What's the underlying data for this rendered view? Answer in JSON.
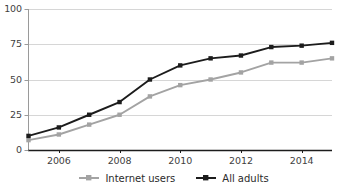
{
  "chart_data": {
    "type": "line",
    "title": "",
    "subtitle": "",
    "xlabel": "",
    "ylabel": "",
    "x": [
      2005,
      2006,
      2007,
      2008,
      2009,
      2010,
      2011,
      2012,
      2013,
      2014,
      2015
    ],
    "xlim": [
      2005,
      2015
    ],
    "ylim": [
      0,
      100
    ],
    "yticks": [
      0,
      25,
      50,
      75,
      100
    ],
    "ytick_labels": [
      "0",
      "25",
      "50",
      "75",
      "100"
    ],
    "xticks": [
      2006,
      2008,
      2010,
      2012,
      2014
    ],
    "xtick_labels": [
      "2006",
      "2008",
      "2010",
      "2012",
      "2014"
    ],
    "grid": true,
    "grid_axis": "y",
    "legend_position": "bottom",
    "markers": "square",
    "series": [
      {
        "name": "Internet users",
        "color": "#a3a3a3",
        "values": [
          7,
          11,
          18,
          25,
          38,
          46,
          50,
          55,
          62,
          62,
          65
        ]
      },
      {
        "name": "All adults",
        "color": "#1c1c1c",
        "values": [
          10,
          16,
          25,
          34,
          50,
          60,
          65,
          67,
          73,
          74,
          76
        ]
      }
    ]
  },
  "axes": {
    "y_tick_labels": [
      "100",
      "75",
      "50",
      "25",
      "0"
    ],
    "x_tick_labels": [
      "2006",
      "2008",
      "2010",
      "2012",
      "2014"
    ]
  },
  "legend": {
    "items": [
      {
        "label": "Internet users",
        "color": "#a3a3a3",
        "icon": "line-marker-icon"
      },
      {
        "label": "All adults",
        "color": "#1c1c1c",
        "icon": "line-marker-icon"
      }
    ]
  },
  "colors": {
    "internet_users": "#a3a3a3",
    "all_adults": "#1c1c1c",
    "gridline": "#d6d6d6",
    "axis": "#1c1c1c",
    "text": "#3f3f3f",
    "background": "#ffffff"
  }
}
